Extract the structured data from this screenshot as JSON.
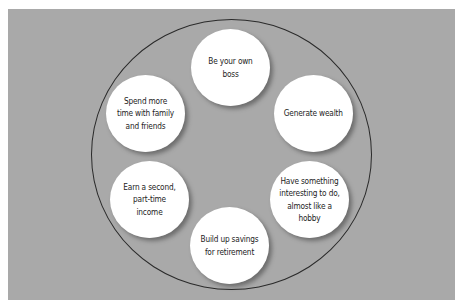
{
  "diagram": {
    "type": "circular-motivations",
    "nodes": [
      {
        "id": "top",
        "label": "Be your own boss"
      },
      {
        "id": "right-top",
        "label": "Generate wealth"
      },
      {
        "id": "right-bottom",
        "label": "Have something interesting to do, almost like a hobby"
      },
      {
        "id": "bottom",
        "label": "Build up savings for retirement"
      },
      {
        "id": "left-bottom",
        "label": "Earn a second, part-time income"
      },
      {
        "id": "left-top",
        "label": "Spend more time with family and friends"
      }
    ],
    "colors": {
      "panel": "#a9a9a9",
      "node_fill": "#ffffff",
      "outline": "#2a2a2a",
      "text": "#1c1c1c"
    }
  }
}
